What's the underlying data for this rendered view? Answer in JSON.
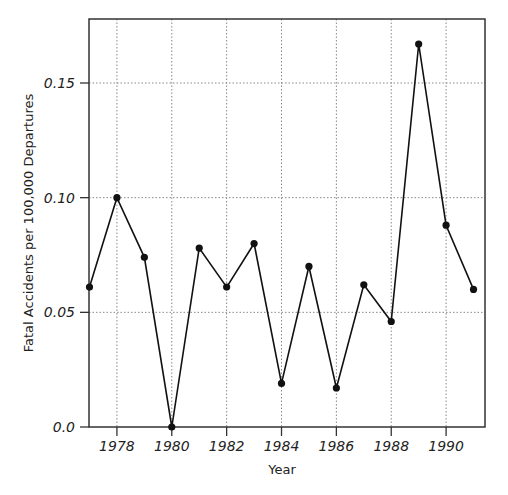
{
  "chart_data": {
    "type": "line",
    "title": "",
    "xlabel": "Year",
    "ylabel": "Fatal Accidents per 100,000 Departures",
    "x": [
      1977,
      1978,
      1979,
      1980,
      1981,
      1982,
      1983,
      1984,
      1985,
      1986,
      1987,
      1988,
      1989,
      1990,
      1991
    ],
    "series": [
      {
        "name": "Fatal accident rate",
        "values": [
          0.061,
          0.1,
          0.074,
          0.0,
          0.078,
          0.061,
          0.08,
          0.019,
          0.07,
          0.017,
          0.062,
          0.046,
          0.167,
          0.088,
          0.06
        ]
      }
    ],
    "xlim": [
      1977,
      1991.4
    ],
    "ylim": [
      0.0,
      0.178
    ],
    "xticks": [
      1978,
      1980,
      1982,
      1984,
      1986,
      1988,
      1990
    ],
    "xtick_labels": [
      "1978",
      "1980",
      "1982",
      "1984",
      "1986",
      "1988",
      "1990"
    ],
    "yticks": [
      0.0,
      0.05,
      0.1,
      0.15
    ],
    "ytick_labels": [
      "0.0",
      "0.05",
      "0.10",
      "0.15"
    ],
    "grid": true,
    "legend": null
  },
  "colors": {
    "line": "#111111",
    "marker": "#111111",
    "grid": "#888888",
    "axis": "#333333"
  }
}
